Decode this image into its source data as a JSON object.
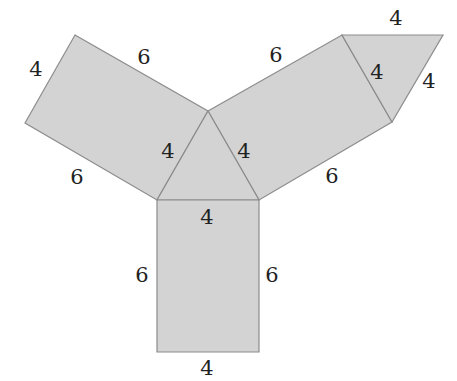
{
  "diagram": {
    "type": "triangular-prism-net",
    "colors": {
      "face_fill": "#d3d3d3",
      "edge_stroke": "#8c8c8c",
      "label_text": "#222222",
      "background": "#ffffff"
    },
    "faces": [
      {
        "name": "left-rectangle",
        "shape": "rectangle",
        "sides": [
          4,
          6
        ]
      },
      {
        "name": "right-rectangle",
        "shape": "rectangle",
        "sides": [
          4,
          6
        ]
      },
      {
        "name": "bottom-rectangle",
        "shape": "rectangle",
        "sides": [
          4,
          6
        ]
      },
      {
        "name": "center-triangle",
        "shape": "equilateral-triangle",
        "sides": [
          4,
          4,
          4
        ]
      },
      {
        "name": "top-right-triangle",
        "shape": "equilateral-triangle",
        "sides": [
          4,
          4,
          4
        ]
      }
    ],
    "labels": {
      "left_rect_outer_short": "4",
      "left_rect_top_long": "6",
      "left_rect_bottom_long": "6",
      "center_tri_left": "4",
      "center_tri_right": "4",
      "center_tri_base": "4",
      "right_rect_top_long": "6",
      "right_rect_bottom_long": "6",
      "right_rect_inner_short": "4",
      "top_tri_top": "4",
      "top_tri_right": "4",
      "bottom_rect_left": "6",
      "bottom_rect_right": "6",
      "bottom_rect_bottom": "4"
    }
  }
}
